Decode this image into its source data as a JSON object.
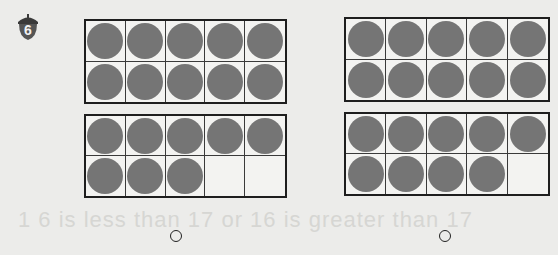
{
  "problem": {
    "number": "6",
    "badge_color": "#4a4a4a"
  },
  "bleed_through_text": "1 6 is less than 17        or 16 is greater than 17",
  "options": [
    {
      "id": "left",
      "ten_frames": [
        {
          "filled": 10,
          "total": 10
        },
        {
          "filled": 8,
          "total": 10
        }
      ],
      "represented_number": 18,
      "radio_selected": false
    },
    {
      "id": "right",
      "ten_frames": [
        {
          "filled": 10,
          "total": 10
        },
        {
          "filled": 9,
          "total": 10
        }
      ],
      "represented_number": 19,
      "radio_selected": false
    }
  ],
  "colors": {
    "counter": "#757575",
    "frame_border": "#1e1e1e",
    "paper": "#ececea"
  }
}
